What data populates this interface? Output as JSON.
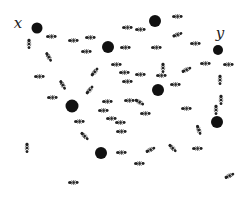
{
  "figure": {
    "width": 245,
    "height": 199,
    "background": "#ffffff",
    "dot_color": "#111111",
    "ant_color": "#222222"
  },
  "labels": [
    {
      "id": "x",
      "text": "x",
      "x": 18,
      "y": 23
    },
    {
      "id": "y",
      "text": "y",
      "x": 220,
      "y": 33
    }
  ],
  "nodes": [
    {
      "id": "x-node",
      "x": 37,
      "y": 28,
      "r": 5.5
    },
    {
      "id": "n2",
      "x": 108,
      "y": 47,
      "r": 6
    },
    {
      "id": "n3",
      "x": 155,
      "y": 21,
      "r": 6
    },
    {
      "id": "y-node",
      "x": 218,
      "y": 50,
      "r": 5
    },
    {
      "id": "n5",
      "x": 72,
      "y": 106,
      "r": 6.5
    },
    {
      "id": "n6",
      "x": 158,
      "y": 90,
      "r": 6
    },
    {
      "id": "n7",
      "x": 217,
      "y": 122,
      "r": 6
    },
    {
      "id": "n8",
      "x": 101,
      "y": 153,
      "r": 6
    }
  ],
  "ants": [
    {
      "x": 52,
      "y": 36,
      "a": 0
    },
    {
      "x": 74,
      "y": 40,
      "a": 0
    },
    {
      "x": 91,
      "y": 37,
      "a": 0
    },
    {
      "x": 87,
      "y": 51,
      "a": 0
    },
    {
      "x": 29,
      "y": 44,
      "a": 90
    },
    {
      "x": 49,
      "y": 57,
      "a": 60
    },
    {
      "x": 117,
      "y": 64,
      "a": 0
    },
    {
      "x": 95,
      "y": 71,
      "a": -50
    },
    {
      "x": 40,
      "y": 76,
      "a": 0
    },
    {
      "x": 63,
      "y": 85,
      "a": 60
    },
    {
      "x": 90,
      "y": 89,
      "a": -50
    },
    {
      "x": 53,
      "y": 97,
      "a": 0
    },
    {
      "x": 128,
      "y": 27,
      "a": 0
    },
    {
      "x": 141,
      "y": 29,
      "a": 0
    },
    {
      "x": 178,
      "y": 16,
      "a": 0
    },
    {
      "x": 178,
      "y": 34,
      "a": -20
    },
    {
      "x": 157,
      "y": 47,
      "a": 0
    },
    {
      "x": 126,
      "y": 47,
      "a": 0
    },
    {
      "x": 196,
      "y": 43,
      "a": 0
    },
    {
      "x": 128,
      "y": 81,
      "a": 0
    },
    {
      "x": 141,
      "y": 74,
      "a": 0
    },
    {
      "x": 162,
      "y": 75,
      "a": 0
    },
    {
      "x": 163,
      "y": 68,
      "a": 90
    },
    {
      "x": 187,
      "y": 69,
      "a": -25
    },
    {
      "x": 206,
      "y": 63,
      "a": 0
    },
    {
      "x": 229,
      "y": 64,
      "a": 0
    },
    {
      "x": 220,
      "y": 80,
      "a": 90
    },
    {
      "x": 130,
      "y": 100,
      "a": 0
    },
    {
      "x": 125,
      "y": 72,
      "a": 0
    },
    {
      "x": 176,
      "y": 84,
      "a": 0
    },
    {
      "x": 187,
      "y": 108,
      "a": 0
    },
    {
      "x": 140,
      "y": 102,
      "a": 30
    },
    {
      "x": 146,
      "y": 113,
      "a": 0
    },
    {
      "x": 221,
      "y": 100,
      "a": 90
    },
    {
      "x": 216,
      "y": 110,
      "a": 90
    },
    {
      "x": 108,
      "y": 101,
      "a": 0
    },
    {
      "x": 104,
      "y": 110,
      "a": 0
    },
    {
      "x": 80,
      "y": 121,
      "a": 0
    },
    {
      "x": 85,
      "y": 136,
      "a": 45
    },
    {
      "x": 112,
      "y": 118,
      "a": 0
    },
    {
      "x": 121,
      "y": 122,
      "a": 0
    },
    {
      "x": 27,
      "y": 148,
      "a": 90
    },
    {
      "x": 122,
      "y": 152,
      "a": 0
    },
    {
      "x": 151,
      "y": 149,
      "a": -25
    },
    {
      "x": 173,
      "y": 148,
      "a": 45
    },
    {
      "x": 198,
      "y": 148,
      "a": 0
    },
    {
      "x": 199,
      "y": 130,
      "a": 70
    },
    {
      "x": 140,
      "y": 163,
      "a": 0
    },
    {
      "x": 230,
      "y": 175,
      "a": -25
    },
    {
      "x": 74,
      "y": 182,
      "a": 0
    },
    {
      "x": 122,
      "y": 131,
      "a": 0
    }
  ]
}
